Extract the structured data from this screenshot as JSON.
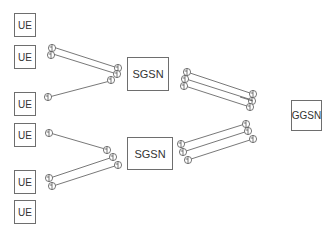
{
  "diagram": {
    "ue_nodes": [
      {
        "label": "UE",
        "top": 13
      },
      {
        "label": "UE",
        "top": 45
      },
      {
        "label": "UE",
        "top": 92
      },
      {
        "label": "UE",
        "top": 123
      },
      {
        "label": "UE",
        "top": 170
      },
      {
        "label": "UE",
        "top": 200
      }
    ],
    "sgsn_nodes": [
      {
        "label": "SGSN",
        "left": 127,
        "top": 57,
        "width": 42,
        "height": 34
      },
      {
        "label": "SGSN",
        "left": 127,
        "top": 137,
        "width": 46,
        "height": 33
      }
    ],
    "ggsn_node": {
      "label": "GGSN",
      "left": 291,
      "top": 100,
      "width": 31,
      "height": 31
    },
    "colors": {
      "line": "#555555",
      "border": "#6e6e6e",
      "text": "#333333"
    }
  }
}
